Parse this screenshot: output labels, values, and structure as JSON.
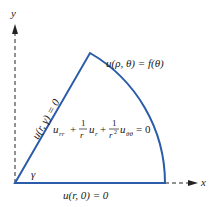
{
  "diagram": {
    "axes": {
      "x_label": "x",
      "y_label": "y"
    },
    "boundary_conditions": {
      "arc": "u(ρ, θ) = f(θ)",
      "ray": "u(r, γ) = 0",
      "x_axis": "u(r, 0) = 0"
    },
    "angle_label": "γ",
    "pde": {
      "term1": "u",
      "term1_sub": "rr",
      "plus1": "+",
      "frac1_num": "1",
      "frac1_den": "r",
      "term2": "u",
      "term2_sub": "r",
      "plus2": "+",
      "frac2_num": "1",
      "frac2_den": "r",
      "frac2_den_sup": "2",
      "term3": "u",
      "term3_sub": "θθ",
      "equals": "= 0"
    },
    "colors": {
      "boundary": "#2a5caa",
      "axis": "#222222",
      "text": "#1a1a1a"
    }
  }
}
